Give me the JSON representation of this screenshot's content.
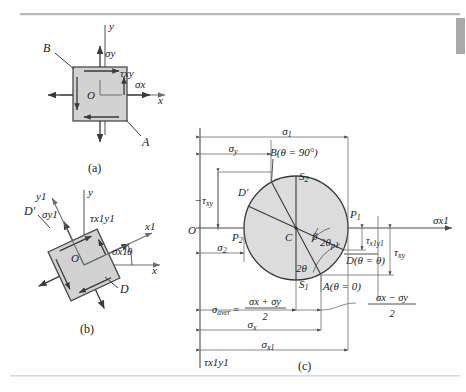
{
  "page": {
    "background": "#ffffff",
    "rule_color": "#b9b9b9",
    "scrollbar_color": "#8f8f8f",
    "ink_color": "#222222",
    "element_fill": "#d2d2d2",
    "circle_fill": "#dcdcdc"
  },
  "panels": [
    {
      "id": "a",
      "caption": "(a)"
    },
    {
      "id": "b",
      "caption": "(b)"
    },
    {
      "id": "c",
      "caption": "(c)"
    }
  ],
  "panel_a": {
    "caption": "(a)",
    "axis_x": "x",
    "axis_y": "y",
    "origin": "O",
    "corner_top_left": "B",
    "corner_bottom_right": "A",
    "sigma_x": "σx",
    "sigma_y": "σy",
    "tau_xy": "τxy"
  },
  "panel_b": {
    "caption": "(b)",
    "axis_x": "x",
    "axis_y": "y",
    "axis_x1": "x1",
    "axis_y1": "y1",
    "origin": "O",
    "face_D": "D",
    "face_Dprime": "D′",
    "sigma_x1": "σx1",
    "sigma_y1": "σy1",
    "tau_x1y1": "τx1y1",
    "angle_theta": "θ"
  },
  "panel_c": {
    "caption": "(c)",
    "origin": "O",
    "center": "C",
    "axis_sigma": "σx1",
    "axis_tau": "τx1y1",
    "point_P1": "P1",
    "point_P2": "P2",
    "point_S1": "S1",
    "point_S2": "S2",
    "point_A": "A(θ = 0)",
    "point_B": "B(θ = 90°)",
    "point_D": "D(θ = θ)",
    "point_Dprime": "D′",
    "angle_beta": "β",
    "angle_2theta": "2θ",
    "angle_2theta_p1": "2θp1",
    "dim_sigma1": "σ1",
    "dim_sigma2": "σ2",
    "dim_sigma_x": "σx",
    "dim_sigma_y": "σy",
    "dim_sigma_x1": "σx1",
    "dim_tau_xy": "τxy",
    "dim_neg_tau_xy": "−τxy",
    "dim_tau_x1y1": "τx1y1",
    "dim_sigma_aver": "σaver =",
    "frac_aver_num": "σx + σy",
    "frac_aver_den": "2",
    "frac_half_num": "σx − σy",
    "frac_half_den": "2"
  }
}
